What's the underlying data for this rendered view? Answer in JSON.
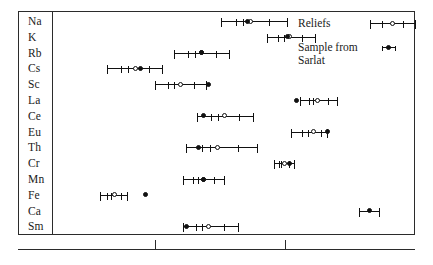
{
  "figure": {
    "title": "",
    "row_label_font_size": 11.5
  },
  "legend": {
    "position": "top-right",
    "entries": [
      {
        "label": "Reliefs",
        "marker": "open-circle",
        "has_error_bars": true
      },
      {
        "label": "Sample from\nSarlat",
        "marker": "filled-circle",
        "has_error_bars": false
      }
    ]
  },
  "axis": {
    "labelled": false,
    "tick_positions_px": [
      155,
      285
    ],
    "tick_labels": [
      "",
      ""
    ]
  },
  "chart_data": {
    "type": "scatter",
    "title": "",
    "xlabel": "",
    "ylabel": "",
    "orientation": "horizontal",
    "grid": false,
    "legend_position": "top-right",
    "categories": [
      "Na",
      "K",
      "Rb",
      "Cs",
      "Sc",
      "La",
      "Ce",
      "Eu",
      "Th",
      "Cr",
      "Mn",
      "Fe",
      "Ca",
      "Sm"
    ],
    "xlim": [
      0,
      100
    ],
    "series": [
      {
        "name": "Reliefs",
        "marker": "open-circle",
        "values": [
          54.5,
          65.5,
          40.5,
          21.5,
          34.5,
          73.5,
          47.0,
          72.5,
          45.0,
          64.0,
          41.0,
          15.5,
          null,
          42.5
        ],
        "err_low": [
          8.5,
          6.5,
          8.0,
          8.0,
          7.5,
          5.0,
          8.0,
          6.5,
          9.0,
          3.0,
          6.0,
          4.0,
          null,
          7.5
        ],
        "err_high": [
          10.5,
          7.5,
          8.0,
          8.0,
          7.5,
          6.0,
          8.5,
          4.0,
          11.5,
          3.0,
          6.0,
          4.0,
          null,
          8.5
        ],
        "inner_ticks": true
      },
      {
        "name": "Sample from Sarlat",
        "marker": "filled-circle",
        "values": [
          53.5,
          65.0,
          40.5,
          23.0,
          42.5,
          67.5,
          41.0,
          76.5,
          39.5,
          65.5,
          41.0,
          24.5,
          88.5,
          36.0
        ],
        "err_low": [
          null,
          null,
          null,
          null,
          null,
          null,
          null,
          null,
          null,
          null,
          null,
          null,
          3.0,
          null
        ],
        "err_high": [
          null,
          null,
          null,
          null,
          null,
          null,
          null,
          null,
          null,
          null,
          null,
          null,
          3.0,
          null
        ]
      }
    ]
  }
}
